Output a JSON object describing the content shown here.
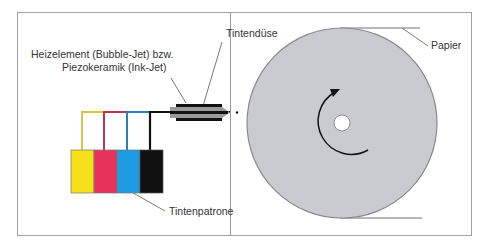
{
  "diagram": {
    "labels": {
      "heater_line1": "Heizelement (Bubble-Jet) bzw.",
      "heater_line2": "Piezokeramik (Ink-Jet)",
      "nozzle": "Tintendüse",
      "paper": "Papier",
      "cartridge": "Tintenpatrone"
    },
    "cartridges": [
      {
        "name": "yellow",
        "color": "#f5e11a"
      },
      {
        "name": "magenta",
        "color": "#e8325e"
      },
      {
        "name": "cyan",
        "color": "#1e9be0"
      },
      {
        "name": "black",
        "color": "#111111"
      }
    ],
    "colors": {
      "frame": "#9a9a9a",
      "drum": "#c9cbd0",
      "drum_edge": "#8a8a8a",
      "nozzle": "#9a9a9a"
    }
  }
}
